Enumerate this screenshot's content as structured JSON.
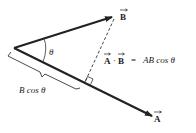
{
  "diagram": {
    "vectors": {
      "A": {
        "label": "A",
        "has_arrow_accent": true
      },
      "B": {
        "label": "B",
        "has_arrow_accent": true
      }
    },
    "angle_label": "θ",
    "equation": {
      "lhs_a": "A",
      "dot": "·",
      "lhs_b": "B",
      "equals": "=",
      "rhs": "AB cos θ"
    },
    "projection_label": "B cos θ",
    "colors": {
      "vector_stroke": "#222222",
      "dashed_line": "#333333",
      "text": "#222222",
      "background": "#ffffff"
    }
  }
}
